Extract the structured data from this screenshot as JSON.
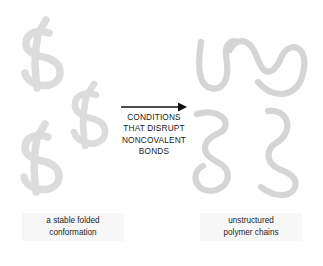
{
  "figure": {
    "background_color": "#ffffff",
    "width": 323,
    "height": 266,
    "folded_shape_color": "#dcdcdc",
    "chain_shape_color": "#d5d5d5",
    "text_color": "#1a1a1a",
    "arrow_color": "#111111"
  },
  "process_arrow": {
    "direction": "right",
    "label_lines": [
      "CONDITIONS",
      "THAT DISRUPT",
      "NONCOVALENT",
      "BONDS"
    ],
    "line1": "CONDITIONS",
    "line2": "THAT DISRUPT",
    "line3": "NONCOVALENT",
    "line4": "BONDS"
  },
  "left_panel": {
    "caption_line1": "a stable folded",
    "caption_line2": "conformation",
    "shape_count": 3,
    "shape_kind": "folded-knotted-protein"
  },
  "right_panel": {
    "caption_line1": "unstructured",
    "caption_line2": "polymer chains",
    "shape_count": 4,
    "shape_kind": "random-coil-chain"
  }
}
